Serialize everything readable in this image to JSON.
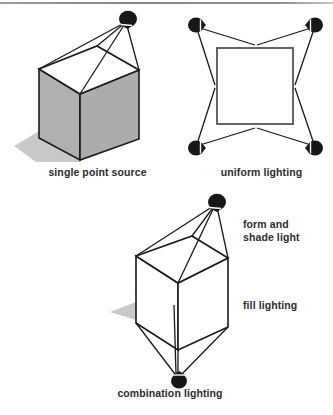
{
  "figure": {
    "background_color": "#ffffff",
    "ink_color": "#1a1a1a",
    "cube_face_gray": "#b0b0b0",
    "cube_face_gray_dark": "#a3a3a3",
    "shadow_gray": "#c9c9c9",
    "lamp_color": "#171717"
  },
  "panels": {
    "single_point": {
      "caption": "single point source",
      "lamp_count": 1,
      "cube_shaded": true,
      "shadow": true
    },
    "uniform": {
      "caption": "uniform lighting",
      "lamp_count": 4,
      "subject": "square",
      "cube_shaded": false,
      "shadow": false
    },
    "combination": {
      "caption": "combination lighting",
      "lamp_count": 2,
      "cube_shaded": false,
      "shadow": true,
      "labels": {
        "top_light_line1": "form and",
        "top_light_line2": "shade light",
        "bottom_light": "fill lighting"
      }
    }
  }
}
